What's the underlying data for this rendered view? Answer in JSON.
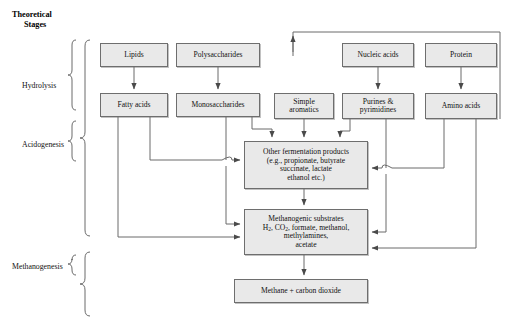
{
  "title": {
    "line1": "Theoretical",
    "line2": "Stages"
  },
  "stages": [
    {
      "id": "hydrolysis",
      "label": "Hydrolysis"
    },
    {
      "id": "acidogenesis",
      "label": "Acidogenesis"
    },
    {
      "id": "methanogenesis",
      "label": "Methanogenesis"
    }
  ],
  "nodes": {
    "lipids": {
      "label": "Lipids"
    },
    "polysaccharides": {
      "label": "Polysaccharides"
    },
    "nucleic_acids": {
      "label": "Nucleic acids"
    },
    "protein": {
      "label": "Protein"
    },
    "fatty_acids": {
      "label": "Fatty acids"
    },
    "monosaccharides": {
      "label": "Monosaccharides"
    },
    "simple_aromatics": {
      "line1": "Simple",
      "line2": "aromatics"
    },
    "purines_pyrimidines": {
      "line1": "Purines &",
      "line2": "pyrimidines"
    },
    "amino_acids": {
      "label": "Amino acids"
    },
    "fermentation_products": {
      "line1": "Other fermentation products",
      "line2": "(e.g., propionate, butyrate",
      "line3": "succinate, lactate",
      "line4": "ethanol etc.)"
    },
    "methanogenic_substrates": {
      "line1": "Methanogenic substrates",
      "line2_a": "H",
      "line2_sub1": "2",
      "line2_b": ", CO",
      "line2_sub2": "2",
      "line2_c": ", formate, methanol,",
      "line3": "methylamines,",
      "line4": "acetate"
    },
    "methane": {
      "label": "Methane + carbon dioxide"
    }
  },
  "colors": {
    "box_fill": "#e9e9e9",
    "box_border": "#6e6e6e",
    "line": "#4a4a4a",
    "text": "#111111",
    "background": "#ffffff"
  }
}
